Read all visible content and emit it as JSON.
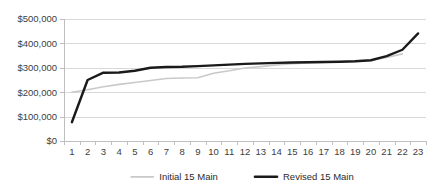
{
  "chart_data": {
    "type": "line",
    "title": "",
    "subtitle": "",
    "xlabel": "",
    "ylabel": "",
    "grid": true,
    "legend_position": "bottom",
    "categories": [
      1,
      2,
      3,
      4,
      5,
      6,
      7,
      8,
      9,
      10,
      11,
      12,
      13,
      14,
      15,
      16,
      17,
      18,
      19,
      20,
      21,
      22,
      23
    ],
    "x_tick_labels": [
      "1",
      "2",
      "3",
      "4",
      "5",
      "6",
      "7",
      "8",
      "9",
      "10",
      "11",
      "12",
      "13",
      "14",
      "15",
      "16",
      "17",
      "18",
      "19",
      "20",
      "21",
      "22",
      "23"
    ],
    "ylim": [
      0,
      500000
    ],
    "y_ticks": [
      0,
      100000,
      200000,
      300000,
      400000,
      500000
    ],
    "y_tick_labels": [
      "$0",
      "$100,000",
      "$200,000",
      "$300,000",
      "$400,000",
      "$500,000"
    ],
    "series": [
      {
        "name": "Initial 15 Main",
        "color": "#c9c9c9",
        "width": 1.6,
        "values": [
          200000,
          210000,
          222000,
          232000,
          240000,
          248000,
          256000,
          258000,
          259000,
          278000,
          288000,
          299000,
          305000,
          312000,
          317000,
          320000,
          322000,
          324000,
          326000,
          330000,
          342000,
          357000,
          null
        ]
      },
      {
        "name": "Revised 15 Main",
        "color": "#1a1a1a",
        "width": 2.4,
        "values": [
          77000,
          250000,
          280000,
          281000,
          288000,
          300000,
          303000,
          304000,
          307000,
          310000,
          313000,
          316000,
          318000,
          320000,
          322000,
          323000,
          324000,
          325000,
          327000,
          331000,
          348000,
          374000,
          441000
        ]
      }
    ]
  },
  "legend": {
    "items": [
      {
        "label": "Initial 15 Main",
        "color": "#c9c9c9"
      },
      {
        "label": "Revised 15 Main",
        "color": "#1a1a1a"
      }
    ]
  },
  "plot_area": {
    "left": 64,
    "top": 19,
    "right": 426,
    "bottom": 141
  }
}
